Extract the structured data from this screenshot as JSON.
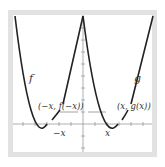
{
  "figure": {
    "curves": [
      {
        "name": "f",
        "label": "f",
        "color": "#222222"
      },
      {
        "name": "g",
        "label": "g",
        "color": "#222222"
      }
    ],
    "points": [
      {
        "label": "(−x, f(−x))",
        "x_label": "−x"
      },
      {
        "label": "(x, g(x))",
        "x_label": "x"
      }
    ],
    "colors": {
      "frame": "#e2e2e2",
      "axis": "#9a9a9a",
      "curve": "#222222",
      "text": "#333333"
    }
  }
}
